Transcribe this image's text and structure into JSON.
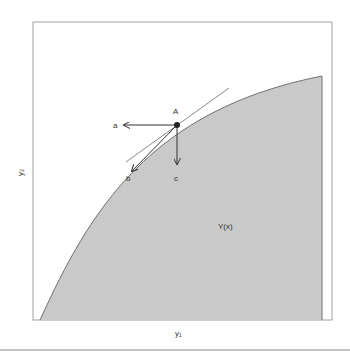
{
  "diagram": {
    "point_label": "A",
    "arrows": [
      "a",
      "b",
      "c"
    ],
    "region_label": "Y(x)",
    "xlabel": "y₁",
    "ylabel": "y₂",
    "colors": {
      "region_fill": "#c8c8c8",
      "boundary": "#6e6e6e",
      "frame": "#9a9a9a",
      "arrow": "#333333"
    }
  }
}
